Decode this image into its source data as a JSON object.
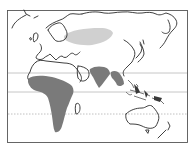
{
  "map": {
    "type": "world-distribution-map",
    "extent": "Eastern Hemisphere (Europe, Africa, Asia, Oceania)",
    "colors": {
      "background": "#ffffff",
      "outline": "#2a2a2a",
      "primary_range": "#7a7a7a",
      "secondary_range": "#d0d0d0",
      "reference_lines": "#b8b8b8"
    },
    "reference_lines": [
      {
        "name": "tropic-of-cancer",
        "style": "solid"
      },
      {
        "name": "equator",
        "style": "solid"
      },
      {
        "name": "tropic-of-capricorn",
        "style": "dotted"
      }
    ],
    "regions": [
      {
        "name": "central-asia-siberia",
        "shade": "light"
      },
      {
        "name": "sub-saharan-africa",
        "shade": "dark"
      },
      {
        "name": "indian-subcontinent",
        "shade": "dark"
      },
      {
        "name": "southeast-asia",
        "shade": "dark"
      }
    ]
  }
}
